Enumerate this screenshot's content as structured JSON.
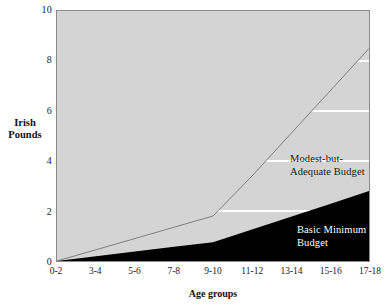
{
  "chart_data": {
    "type": "area",
    "title": "",
    "xlabel": "Age groups",
    "ylabel": "Irish Pounds",
    "ylim": [
      0,
      10
    ],
    "yticks": [
      0,
      2,
      4,
      6,
      8,
      10
    ],
    "ytick_labels": [
      "0",
      "2",
      "4",
      "6",
      "8",
      "10"
    ],
    "grid": "horizontal-white-gridlines",
    "legend_position": "inline-annotations",
    "categories": [
      "0-2",
      "3-4",
      "5-6",
      "7-8",
      "9-10",
      "11-12",
      "13-14",
      "15-16",
      "17-18"
    ],
    "series": [
      {
        "name": "Modest-but-Adequate Budget",
        "fill": "#d4d4d4",
        "values": [
          0,
          0.45,
          0.9,
          1.35,
          1.8,
          3.4,
          5.1,
          6.8,
          8.5
        ]
      },
      {
        "name": "Basic Minimum Budget",
        "fill": "#000000",
        "values": [
          0,
          0.19,
          0.38,
          0.57,
          0.75,
          1.26,
          1.77,
          2.28,
          2.8
        ]
      }
    ],
    "annotations": [
      {
        "id": "modest",
        "text": "Modest-but-\nAdequate Budget"
      },
      {
        "id": "basic",
        "text": "Basic Minimum\nBudget"
      }
    ],
    "colors": {
      "modest_area": "#d4d4d4",
      "basic_area": "#000000",
      "gridline": "#ffffff",
      "axis": "#8a8a8a",
      "text": "#1a1a1a",
      "background": "#ffffff"
    }
  }
}
